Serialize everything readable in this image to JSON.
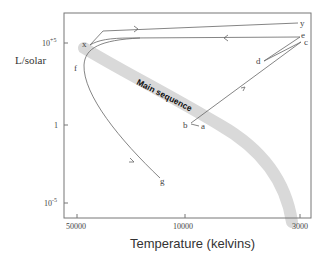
{
  "diagram": {
    "type": "hertzsprung-russell-evolution-track",
    "y_axis": {
      "label": "L/solar",
      "ticks": [
        "10^+5",
        "1",
        "10^-5"
      ],
      "tick_sup": [
        "+5",
        "",
        "-5"
      ],
      "tick_base": [
        "10",
        "1",
        "10"
      ]
    },
    "x_axis": {
      "label": "Temperature (kelvins)",
      "ticks": [
        "50000",
        "10000",
        "3000"
      ]
    },
    "band_label": "Main sequence",
    "points": {
      "a": "a",
      "b": "b",
      "c": "c",
      "d": "d",
      "e": "e",
      "f": "f",
      "g": "g",
      "x": "x",
      "y": "y"
    },
    "colors": {
      "axis": "#777777",
      "track": "#666666",
      "band": "#d9d9d9"
    }
  }
}
